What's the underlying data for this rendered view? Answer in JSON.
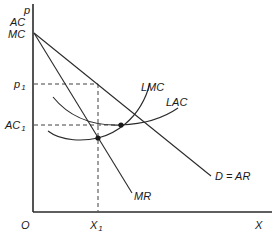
{
  "diagram": {
    "type": "economics-monopoly-long-run-equilibrium",
    "axes": {
      "y_label_lines": [
        "p",
        "AC",
        "MC"
      ],
      "x_label": "X",
      "origin_label": "O"
    },
    "curves": {
      "demand": "D = AR",
      "marginal_revenue": "MR",
      "long_run_marginal_cost": "LMC",
      "long_run_average_cost": "LAC"
    },
    "markers": {
      "price": {
        "main": "p",
        "sub": "1"
      },
      "average_cost": {
        "main": "AC",
        "sub": "1"
      },
      "quantity": {
        "main": "X",
        "sub": "1"
      }
    },
    "colors": {
      "ink": "#2a2a2a",
      "background": "#ffffff"
    }
  }
}
